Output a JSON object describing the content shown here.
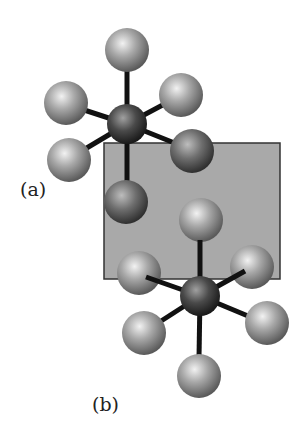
{
  "figure": {
    "labels": {
      "a": "(a)",
      "b": "(b)"
    },
    "plane": {
      "x": 104,
      "y": 143,
      "w": 176,
      "h": 136,
      "fill": "#a9a9a9",
      "stroke": "#333333"
    },
    "molecule_a": {
      "center": [
        127,
        124
      ],
      "ligands_back": [
        [
          127,
          50
        ],
        [
          66,
          103
        ],
        [
          181,
          95
        ]
      ],
      "ligands_front": [
        [
          69,
          160
        ],
        [
          192,
          151
        ],
        [
          126,
          202
        ]
      ]
    },
    "molecule_b": {
      "center": [
        200,
        296
      ],
      "ligands_back": [
        [
          201,
          220
        ],
        [
          139,
          273
        ],
        [
          252,
          267
        ]
      ],
      "ligands_front": [
        [
          144,
          333
        ],
        [
          267,
          323
        ],
        [
          199,
          376
        ]
      ]
    }
  }
}
